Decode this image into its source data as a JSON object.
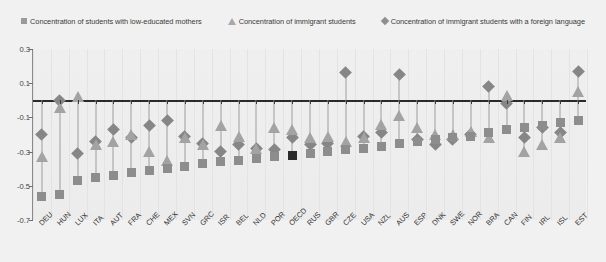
{
  "legend": {
    "items": [
      {
        "icon": "square-marker-icon",
        "label": "Concentration of students with low-educated mothers"
      },
      {
        "icon": "triangle-marker-icon",
        "label": "Concentration of immigrant students"
      },
      {
        "icon": "diamond-marker-icon",
        "label": "Concentration of immigrant students with a foreign language"
      }
    ]
  },
  "axes": {
    "y_ticks": [
      "0.3",
      "0.1",
      "-0.1",
      "-0.3",
      "-0.5",
      "-0.7"
    ],
    "y_min": -0.7,
    "y_max": 0.3
  },
  "colors": {
    "square": "#8d8d8d",
    "triangle": "#a3a3a3",
    "diamond": "#868686",
    "highlight": "#2b2b2b",
    "stem": "#9d9d9d",
    "plot_bg": "#eeeeee",
    "page_bg": "#f1f1f1"
  },
  "highlight_category": "OECD",
  "chart_data": {
    "type": "scatter",
    "title": "",
    "xlabel": "",
    "ylabel": "",
    "ylim": [
      -0.7,
      0.3
    ],
    "grid": true,
    "legend_position": "top",
    "categories": [
      "DEU",
      "HUN",
      "LUX",
      "ITA",
      "AUT",
      "FRA",
      "CHE",
      "MEX",
      "SVN",
      "GRC",
      "ISR",
      "BEL",
      "NLD",
      "POR",
      "OECD",
      "RUS",
      "GBR",
      "CZE",
      "USA",
      "NZL",
      "AUS",
      "ESP",
      "DNK",
      "SWE",
      "NOR",
      "BRA",
      "CAN",
      "FIN",
      "IRL",
      "ISL",
      "EST"
    ],
    "series": [
      {
        "name": "Concentration of students with low-educated mothers",
        "marker": "square",
        "values": [
          -0.56,
          -0.55,
          -0.47,
          -0.45,
          -0.44,
          -0.42,
          -0.41,
          -0.4,
          -0.39,
          -0.37,
          -0.36,
          -0.35,
          -0.34,
          -0.33,
          -0.32,
          -0.31,
          -0.3,
          -0.29,
          -0.28,
          -0.27,
          -0.25,
          -0.24,
          -0.23,
          -0.22,
          -0.21,
          -0.19,
          -0.17,
          -0.16,
          -0.15,
          -0.13,
          -0.12
        ]
      },
      {
        "name": "Concentration of immigrant students",
        "marker": "triangle",
        "values": [
          -0.33,
          -0.04,
          0.02,
          -0.26,
          -0.24,
          -0.2,
          -0.3,
          -0.35,
          -0.22,
          -0.26,
          -0.15,
          -0.21,
          -0.28,
          -0.16,
          -0.17,
          -0.22,
          -0.21,
          -0.24,
          -0.22,
          -0.14,
          -0.09,
          -0.16,
          -0.2,
          -0.2,
          -0.18,
          -0.22,
          0.03,
          -0.3,
          -0.26,
          -0.22,
          0.05
        ]
      },
      {
        "name": "Concentration of immigrant students with a foreign language",
        "marker": "diamond",
        "values": [
          -0.2,
          0.0,
          -0.31,
          -0.24,
          -0.17,
          -0.22,
          -0.15,
          -0.12,
          -0.21,
          -0.25,
          -0.3,
          -0.26,
          -0.28,
          -0.29,
          -0.22,
          -0.26,
          -0.25,
          0.16,
          -0.21,
          -0.19,
          0.15,
          -0.23,
          -0.26,
          -0.23,
          -0.2,
          0.08,
          -0.02,
          -0.22,
          -0.16,
          -0.19,
          0.17
        ]
      }
    ]
  }
}
